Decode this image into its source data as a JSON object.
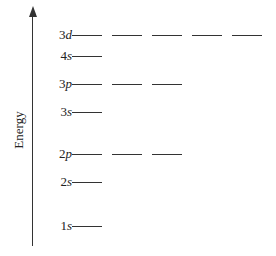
{
  "ylabel": "Energy",
  "levels": [
    {
      "n": "3",
      "l": "d",
      "y": 35,
      "count": 5
    },
    {
      "n": "4",
      "l": "s",
      "y": 56,
      "count": 1
    },
    {
      "n": "3",
      "l": "p",
      "y": 84,
      "count": 3
    },
    {
      "n": "3",
      "l": "s",
      "y": 112,
      "count": 1
    },
    {
      "n": "2",
      "l": "p",
      "y": 154,
      "count": 3
    },
    {
      "n": "2",
      "l": "s",
      "y": 182,
      "count": 1
    },
    {
      "n": "1",
      "l": "s",
      "y": 226,
      "count": 1
    }
  ],
  "layout": {
    "orbital_start_x": 72,
    "orbital_width": 30,
    "orbital_gap": 10
  }
}
